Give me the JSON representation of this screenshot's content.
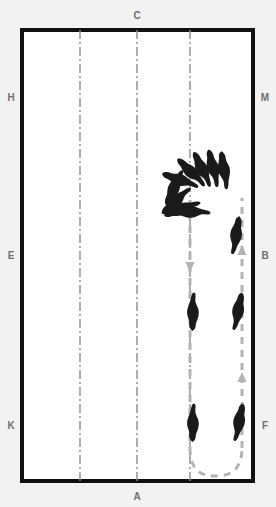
{
  "figure": {
    "kind": "dressage-arena-diagram",
    "background_color": "#f2f2f2",
    "arena_fill": "#ffffff",
    "arena_border_color": "#111111",
    "centerline_color": "#8c8c8c",
    "track_color": "#b0b0b0",
    "horse_color": "#1a1a1a"
  },
  "arena": {
    "x": 20,
    "y": 28,
    "width": 235,
    "height": 455,
    "border_width": 4
  },
  "letters": {
    "top": [
      {
        "label": "C",
        "x": 137,
        "y": 15
      }
    ],
    "bottom": [
      {
        "label": "A",
        "x": 137,
        "y": 496
      }
    ],
    "left": [
      {
        "label": "H",
        "x": 11,
        "y": 98
      },
      {
        "label": "E",
        "x": 11,
        "y": 256
      },
      {
        "label": "K",
        "x": 11,
        "y": 426
      }
    ],
    "right": [
      {
        "label": "M",
        "x": 265,
        "y": 98
      },
      {
        "label": "B",
        "x": 265,
        "y": 256
      },
      {
        "label": "F",
        "x": 265,
        "y": 426
      }
    ]
  },
  "guide_lines": [
    {
      "name": "quarter-line-left",
      "x": 80,
      "y1": 28,
      "y2": 483
    },
    {
      "name": "center-line",
      "x": 137,
      "y1": 28,
      "y2": 483
    },
    {
      "name": "quarter-line-right",
      "x": 190,
      "y1": 28,
      "y2": 483
    }
  ],
  "track_path": {
    "name": "movement-path",
    "description": "down the right quarter line, U-turn at bottom, back up along the track to the turn cluster",
    "down_line_x": 190,
    "up_line_x": 242,
    "down_start_y": 200,
    "turn_bottom_y": 470,
    "up_end_y": 198,
    "arrows": [
      {
        "name": "down-arrow",
        "x": 190,
        "y": 262,
        "direction": "down"
      },
      {
        "name": "up-arrow",
        "x": 242,
        "y": 255,
        "direction": "up"
      },
      {
        "name": "up-arrow-lower",
        "x": 242,
        "y": 382,
        "direction": "up"
      }
    ]
  },
  "horses": [
    {
      "name": "horse-fan-1",
      "cx": 174,
      "cy": 188,
      "angle": 205,
      "scale": 1.0
    },
    {
      "name": "horse-fan-2",
      "cx": 176,
      "cy": 200,
      "angle": 228,
      "scale": 1.0
    },
    {
      "name": "horse-fan-3",
      "cx": 181,
      "cy": 208,
      "angle": 250,
      "scale": 1.0
    },
    {
      "name": "horse-fan-4",
      "cx": 190,
      "cy": 212,
      "angle": 272,
      "scale": 1.0
    },
    {
      "name": "horse-fan-5",
      "cx": 185,
      "cy": 176,
      "angle": 300,
      "scale": 1.0
    },
    {
      "name": "horse-fan-6",
      "cx": 196,
      "cy": 170,
      "angle": 320,
      "scale": 1.0
    },
    {
      "name": "horse-fan-7",
      "cx": 206,
      "cy": 168,
      "angle": 335,
      "scale": 1.0
    },
    {
      "name": "horse-fan-8",
      "cx": 216,
      "cy": 168,
      "angle": 345,
      "scale": 1.0
    },
    {
      "name": "horse-right-upper",
      "cx": 236,
      "cy": 235,
      "angle": 8,
      "scale": 1.0
    },
    {
      "name": "horse-left-middle",
      "cx": 192,
      "cy": 312,
      "angle": 182,
      "scale": 1.0
    },
    {
      "name": "horse-right-middle",
      "cx": 238,
      "cy": 312,
      "angle": 10,
      "scale": 1.0
    },
    {
      "name": "horse-left-lower",
      "cx": 192,
      "cy": 423,
      "angle": 182,
      "scale": 1.0
    },
    {
      "name": "horse-right-lower",
      "cx": 239,
      "cy": 423,
      "angle": 12,
      "scale": 1.0
    }
  ]
}
